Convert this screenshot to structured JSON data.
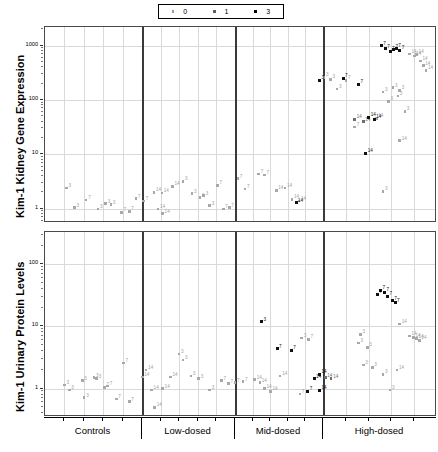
{
  "legend": {
    "position": "top-center",
    "entries": [
      {
        "label": "0",
        "marker": "small-gray-square",
        "style": "g"
      },
      {
        "label": "1",
        "marker": "small-midgray-square",
        "style": "m"
      },
      {
        "label": "3",
        "marker": "small-black-square",
        "style": "b"
      }
    ]
  },
  "axis": {
    "x_groups": [
      "Controls",
      "Low-dosed",
      "Mid-dosed",
      "High-dosed"
    ],
    "top_y_title": "Kim-1 Kidney Gene Expression",
    "bottom_y_title": "Kim-1 Urinary Protein Levels",
    "top_y_ticks": [
      "1000",
      "100",
      "10",
      "1"
    ],
    "bottom_y_ticks": [
      "100",
      "10",
      "1"
    ]
  },
  "chart_data": [
    {
      "type": "scatter",
      "panel": "top",
      "title": "",
      "xlabel": "",
      "ylabel": "Kim-1 Kidney Gene Expression",
      "yscale": "log",
      "ylim": [
        0.55,
        2200
      ],
      "ytick_values": [
        1,
        10,
        100,
        1000
      ],
      "grid": true,
      "legend_field": "severity score",
      "point_label_field": "study day",
      "categories": [
        "Controls",
        "Low-dosed",
        "Mid-dosed",
        "High-dosed"
      ],
      "series": [
        {
          "name": "0",
          "style": "g",
          "points": [
            {
              "x": 0.055,
              "y": 2.4,
              "label": "3"
            },
            {
              "x": 0.105,
              "y": 1.45,
              "label": "7"
            },
            {
              "x": 0.075,
              "y": 1.05,
              "label": "3"
            },
            {
              "x": 0.135,
              "y": 1.0,
              "label": "3"
            },
            {
              "x": 0.155,
              "y": 1.25,
              "label": "3"
            },
            {
              "x": 0.168,
              "y": 1.2,
              "label": "3"
            },
            {
              "x": 0.195,
              "y": 0.86,
              "label": "7"
            },
            {
              "x": 0.215,
              "y": 0.9,
              "label": "7"
            },
            {
              "x": 0.232,
              "y": 1.55,
              "label": "7"
            },
            {
              "x": 0.252,
              "y": 1.4,
              "label": "7"
            },
            {
              "x": 0.288,
              "y": 1.0,
              "label": "14"
            },
            {
              "x": 0.3,
              "y": 0.82,
              "label": "14"
            },
            {
              "x": 0.278,
              "y": 2.0,
              "label": "14"
            },
            {
              "x": 0.298,
              "y": 1.95,
              "label": "14"
            },
            {
              "x": 0.325,
              "y": 2.6,
              "label": "14"
            },
            {
              "x": 0.352,
              "y": 3.2,
              "label": "3"
            },
            {
              "x": 0.375,
              "y": 1.9,
              "label": "3"
            },
            {
              "x": 0.395,
              "y": 1.6,
              "label": "3"
            },
            {
              "x": 0.405,
              "y": 1.75,
              "label": "3"
            },
            {
              "x": 0.42,
              "y": 1.15,
              "label": "3"
            },
            {
              "x": 0.44,
              "y": 2.7,
              "label": "7"
            },
            {
              "x": 0.455,
              "y": 1.0,
              "label": "7"
            },
            {
              "x": 0.47,
              "y": 1.05,
              "label": "7"
            },
            {
              "x": 0.492,
              "y": 3.6,
              "label": "7"
            },
            {
              "x": 0.51,
              "y": 2.3,
              "label": "7"
            },
            {
              "x": 0.545,
              "y": 4.4,
              "label": "7"
            },
            {
              "x": 0.56,
              "y": 4.2,
              "label": "7"
            },
            {
              "x": 0.59,
              "y": 2.2,
              "label": "14"
            },
            {
              "x": 0.612,
              "y": 2.4,
              "label": "14"
            },
            {
              "x": 0.63,
              "y": 1.5,
              "label": "14"
            },
            {
              "x": 0.648,
              "y": 1.4,
              "label": "14"
            },
            {
              "x": 0.712,
              "y": 260.0,
              "label": "3"
            },
            {
              "x": 0.728,
              "y": 240.0,
              "label": "3"
            },
            {
              "x": 0.745,
              "y": 160.0,
              "label": "3"
            },
            {
              "x": 0.768,
              "y": 230.0,
              "label": "7"
            },
            {
              "x": 0.79,
              "y": 32.0,
              "label": "7"
            },
            {
              "x": 0.845,
              "y": 46.0,
              "label": "14"
            },
            {
              "x": 0.862,
              "y": 140.0,
              "label": "3"
            },
            {
              "x": 0.876,
              "y": 95.0,
              "label": "3"
            },
            {
              "x": 0.888,
              "y": 170.0,
              "label": "3"
            },
            {
              "x": 0.9,
              "y": 118.0,
              "label": "3"
            },
            {
              "x": 0.905,
              "y": 150.0,
              "label": "3"
            },
            {
              "x": 0.918,
              "y": 62.0,
              "label": "3"
            },
            {
              "x": 0.93,
              "y": 700.0,
              "label": "14"
            },
            {
              "x": 0.942,
              "y": 640.0,
              "label": "14"
            },
            {
              "x": 0.948,
              "y": 690.0,
              "label": "14"
            },
            {
              "x": 0.958,
              "y": 520.0,
              "label": "14"
            },
            {
              "x": 0.965,
              "y": 430.0,
              "label": "14"
            },
            {
              "x": 0.972,
              "y": 350.0,
              "label": "14"
            },
            {
              "x": 0.905,
              "y": 18.0,
              "label": "14"
            },
            {
              "x": 0.862,
              "y": 2.1,
              "label": "3"
            }
          ]
        },
        {
          "name": "1",
          "style": "m",
          "points": [
            {
              "x": 0.79,
              "y": 44.0,
              "label": "14"
            },
            {
              "x": 0.812,
              "y": 40.0,
              "label": "14"
            }
          ]
        },
        {
          "name": "3",
          "style": "b",
          "points": [
            {
              "x": 0.76,
              "y": 250.0,
              "label": "7"
            },
            {
              "x": 0.8,
              "y": 195.0,
              "label": "7"
            },
            {
              "x": 0.826,
              "y": 48.0,
              "label": "14"
            },
            {
              "x": 0.84,
              "y": 45.0,
              "label": "14"
            },
            {
              "x": 0.818,
              "y": 10.5,
              "label": "14"
            },
            {
              "x": 0.858,
              "y": 1000.0,
              "label": "7"
            },
            {
              "x": 0.868,
              "y": 880.0,
              "label": "7"
            },
            {
              "x": 0.88,
              "y": 800.0,
              "label": "7"
            },
            {
              "x": 0.889,
              "y": 860.0,
              "label": "7"
            },
            {
              "x": 0.896,
              "y": 900.0,
              "label": "7"
            },
            {
              "x": 0.905,
              "y": 830.0,
              "label": "7"
            },
            {
              "x": 0.7,
              "y": 235.0,
              "label": "3"
            },
            {
              "x": 0.64,
              "y": 1.3,
              "label": "14"
            }
          ]
        }
      ]
    },
    {
      "type": "scatter",
      "panel": "bottom",
      "title": "",
      "xlabel": "",
      "ylabel": "Kim-1 Urinary Protein Levels",
      "yscale": "log",
      "ylim": [
        0.35,
        330
      ],
      "ytick_values": [
        1,
        10,
        100
      ],
      "grid": true,
      "legend_field": "severity score",
      "point_label_field": "study day",
      "categories": [
        "Controls",
        "Low-dosed",
        "Mid-dosed",
        "High-dosed"
      ],
      "series": [
        {
          "name": "0",
          "style": "g",
          "points": [
            {
              "x": 0.05,
              "y": 1.15,
              "label": "3"
            },
            {
              "x": 0.062,
              "y": 0.95,
              "label": "3"
            },
            {
              "x": 0.095,
              "y": 1.35,
              "label": "3"
            },
            {
              "x": 0.1,
              "y": 0.72,
              "label": "3"
            },
            {
              "x": 0.125,
              "y": 1.5,
              "label": "3"
            },
            {
              "x": 0.132,
              "y": 1.45,
              "label": "3"
            },
            {
              "x": 0.152,
              "y": 1.05,
              "label": "7"
            },
            {
              "x": 0.16,
              "y": 1.1,
              "label": "7"
            },
            {
              "x": 0.182,
              "y": 0.68,
              "label": "7"
            },
            {
              "x": 0.2,
              "y": 2.6,
              "label": "7"
            },
            {
              "x": 0.215,
              "y": 0.62,
              "label": "7"
            },
            {
              "x": 0.248,
              "y": 1.55,
              "label": "14"
            },
            {
              "x": 0.258,
              "y": 2.0,
              "label": "14"
            },
            {
              "x": 0.272,
              "y": 0.95,
              "label": "14"
            },
            {
              "x": 0.28,
              "y": 0.5,
              "label": "14"
            },
            {
              "x": 0.3,
              "y": 1.0,
              "label": "14"
            },
            {
              "x": 0.32,
              "y": 1.55,
              "label": "14"
            },
            {
              "x": 0.342,
              "y": 3.6,
              "label": "3"
            },
            {
              "x": 0.352,
              "y": 2.9,
              "label": "3"
            },
            {
              "x": 0.372,
              "y": 1.6,
              "label": "3"
            },
            {
              "x": 0.392,
              "y": 1.45,
              "label": "3"
            },
            {
              "x": 0.42,
              "y": 0.95,
              "label": "3"
            },
            {
              "x": 0.45,
              "y": 1.35,
              "label": "7"
            },
            {
              "x": 0.468,
              "y": 1.2,
              "label": "7"
            },
            {
              "x": 0.485,
              "y": 1.25,
              "label": "7"
            },
            {
              "x": 0.505,
              "y": 1.3,
              "label": "7"
            },
            {
              "x": 0.535,
              "y": 1.4,
              "label": "14"
            },
            {
              "x": 0.548,
              "y": 1.25,
              "label": "14"
            },
            {
              "x": 0.56,
              "y": 1.0,
              "label": "14"
            },
            {
              "x": 0.575,
              "y": 0.9,
              "label": "14"
            },
            {
              "x": 0.6,
              "y": 1.6,
              "label": "14"
            },
            {
              "x": 0.65,
              "y": 0.82,
              "label": "7"
            },
            {
              "x": 0.655,
              "y": 6.5,
              "label": "3"
            },
            {
              "x": 0.672,
              "y": 6.2,
              "label": "7"
            },
            {
              "x": 0.805,
              "y": 7.5,
              "label": "3"
            },
            {
              "x": 0.8,
              "y": 5.4,
              "label": "3"
            },
            {
              "x": 0.822,
              "y": 4.6,
              "label": "3"
            },
            {
              "x": 0.812,
              "y": 2.4,
              "label": "3"
            },
            {
              "x": 0.835,
              "y": 2.2,
              "label": "3"
            },
            {
              "x": 0.862,
              "y": 1.7,
              "label": "3"
            },
            {
              "x": 0.88,
              "y": 0.95,
              "label": "3"
            },
            {
              "x": 0.905,
              "y": 11.0,
              "label": "14"
            },
            {
              "x": 0.93,
              "y": 7.0,
              "label": "14"
            },
            {
              "x": 0.94,
              "y": 6.6,
              "label": "14"
            },
            {
              "x": 0.948,
              "y": 6.4,
              "label": "14"
            },
            {
              "x": 0.955,
              "y": 6.0,
              "label": "14"
            },
            {
              "x": 0.898,
              "y": 2.0,
              "label": "14"
            }
          ]
        },
        {
          "name": "1",
          "style": "m",
          "points": [
            {
              "x": 0.715,
              "y": 1.5,
              "label": "14"
            },
            {
              "x": 0.73,
              "y": 1.45,
              "label": "14"
            }
          ]
        },
        {
          "name": "3",
          "style": "b",
          "points": [
            {
              "x": 0.552,
              "y": 12.0,
              "label": "3"
            },
            {
              "x": 0.592,
              "y": 4.4,
              "label": "7"
            },
            {
              "x": 0.628,
              "y": 4.2,
              "label": "7"
            },
            {
              "x": 0.7,
              "y": 1.7,
              "label": "14"
            },
            {
              "x": 0.686,
              "y": 1.45,
              "label": "14"
            },
            {
              "x": 0.7,
              "y": 0.95,
              "label": "14"
            },
            {
              "x": 0.67,
              "y": 0.9,
              "label": "7"
            },
            {
              "x": 0.848,
              "y": 33.0,
              "label": "7"
            },
            {
              "x": 0.856,
              "y": 38.0,
              "label": "7"
            },
            {
              "x": 0.866,
              "y": 36.0,
              "label": "7"
            },
            {
              "x": 0.874,
              "y": 31.0,
              "label": "7"
            },
            {
              "x": 0.886,
              "y": 26.0,
              "label": "7"
            },
            {
              "x": 0.893,
              "y": 24.0,
              "label": "7"
            }
          ]
        }
      ]
    }
  ]
}
